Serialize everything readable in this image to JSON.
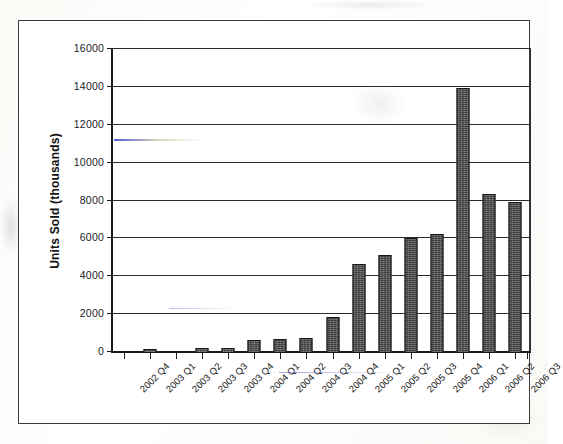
{
  "chart_data": {
    "type": "bar",
    "title": "",
    "xlabel": "",
    "ylabel": "Units Sold (thousands)",
    "ylim": [
      0,
      16000
    ],
    "ytick_step": 2000,
    "ytick_labels": [
      "16000",
      "14000",
      "12000",
      "10000",
      "8000",
      "6000",
      "4000",
      "2000",
      "0"
    ],
    "ytick_values": [
      16000,
      14000,
      12000,
      10000,
      8000,
      6000,
      4000,
      2000,
      0
    ],
    "grid": "horizontal",
    "legend": "none",
    "categories": [
      "2002 Q4",
      "2003 Q1",
      "2003 Q2",
      "2003 Q3",
      "2003 Q4",
      "2004 Q1",
      "2004 Q2",
      "2004 Q3",
      "2004 Q4",
      "2005 Q1",
      "2005 Q2",
      "2005 Q3",
      "2005 Q4",
      "2006 Q1",
      "2006 Q2",
      "2006 Q3"
    ],
    "values": [
      120,
      220,
      90,
      260,
      250,
      680,
      760,
      780,
      1900,
      4700,
      5200,
      6050,
      6300,
      14000,
      8400,
      7950
    ],
    "bar_color": "#4e4e4e",
    "bar_outline_color": "#171717",
    "axis_color": "#1a1a1a",
    "grid_color": "#2a2a2a",
    "background_color": "#ffffff"
  }
}
